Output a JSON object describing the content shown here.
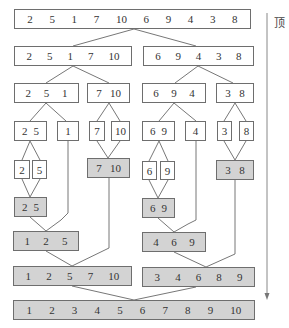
{
  "side_label": "顶",
  "colors": {
    "border": "#6e6e6e",
    "shaded": "#d3d3d3",
    "line": "#777777"
  },
  "boxes": [
    {
      "id": "b0",
      "values": [
        "2",
        "5",
        "1",
        "7",
        "10",
        "6",
        "9",
        "4",
        "3",
        "8"
      ],
      "x": 14,
      "y": 9,
      "w": 237,
      "h": 20,
      "shaded": false
    },
    {
      "id": "b1",
      "values": [
        "2",
        "5",
        "1",
        "7",
        "10"
      ],
      "x": 14,
      "y": 46,
      "w": 118,
      "h": 20,
      "shaded": false
    },
    {
      "id": "b2",
      "values": [
        "6",
        "9",
        "4",
        "3",
        "8"
      ],
      "x": 143,
      "y": 46,
      "w": 111,
      "h": 20,
      "shaded": false
    },
    {
      "id": "b3",
      "values": [
        "2",
        "5",
        "1"
      ],
      "x": 14,
      "y": 83,
      "w": 65,
      "h": 20,
      "shaded": false
    },
    {
      "id": "b4",
      "values": [
        "7",
        "10"
      ],
      "x": 87,
      "y": 83,
      "w": 43,
      "h": 20,
      "shaded": false
    },
    {
      "id": "b5",
      "values": [
        "6",
        "9",
        "4"
      ],
      "x": 142,
      "y": 83,
      "w": 64,
      "h": 20,
      "shaded": false
    },
    {
      "id": "b6",
      "values": [
        "3",
        "8"
      ],
      "x": 216,
      "y": 83,
      "w": 38,
      "h": 20,
      "shaded": false
    },
    {
      "id": "b7",
      "values": [
        "2",
        "5"
      ],
      "x": 14,
      "y": 121,
      "w": 33,
      "h": 20,
      "shaded": false
    },
    {
      "id": "b8",
      "values": [
        "1"
      ],
      "x": 57,
      "y": 121,
      "w": 22,
      "h": 20,
      "shaded": false
    },
    {
      "id": "b9",
      "values": [
        "7"
      ],
      "x": 89,
      "y": 121,
      "w": 16,
      "h": 20,
      "shaded": false
    },
    {
      "id": "b10",
      "values": [
        "10"
      ],
      "x": 111,
      "y": 121,
      "w": 19,
      "h": 20,
      "shaded": false
    },
    {
      "id": "b11",
      "values": [
        "6",
        "9"
      ],
      "x": 142,
      "y": 121,
      "w": 33,
      "h": 20,
      "shaded": false
    },
    {
      "id": "b12",
      "values": [
        "4"
      ],
      "x": 185,
      "y": 121,
      "w": 21,
      "h": 20,
      "shaded": false
    },
    {
      "id": "b13",
      "values": [
        "3"
      ],
      "x": 217,
      "y": 121,
      "w": 15,
      "h": 20,
      "shaded": false
    },
    {
      "id": "b14",
      "values": [
        "8"
      ],
      "x": 239,
      "y": 121,
      "w": 15,
      "h": 20,
      "shaded": false
    },
    {
      "id": "b15",
      "values": [
        "2"
      ],
      "x": 14,
      "y": 160,
      "w": 16,
      "h": 19,
      "shaded": false
    },
    {
      "id": "b16",
      "values": [
        "5"
      ],
      "x": 32,
      "y": 160,
      "w": 15,
      "h": 19,
      "shaded": false
    },
    {
      "id": "b17",
      "values": [
        "7",
        "10"
      ],
      "x": 87,
      "y": 158,
      "w": 43,
      "h": 20,
      "shaded": true
    },
    {
      "id": "b18",
      "values": [
        "6"
      ],
      "x": 142,
      "y": 161,
      "w": 15,
      "h": 19,
      "shaded": false
    },
    {
      "id": "b19",
      "values": [
        "9"
      ],
      "x": 160,
      "y": 161,
      "w": 15,
      "h": 19,
      "shaded": false
    },
    {
      "id": "b20",
      "values": [
        "3",
        "8"
      ],
      "x": 216,
      "y": 160,
      "w": 38,
      "h": 20,
      "shaded": true
    },
    {
      "id": "b21",
      "values": [
        "2",
        "5"
      ],
      "x": 14,
      "y": 197,
      "w": 33,
      "h": 20,
      "shaded": true
    },
    {
      "id": "b22",
      "values": [
        "6",
        "9"
      ],
      "x": 142,
      "y": 198,
      "w": 33,
      "h": 20,
      "shaded": true
    },
    {
      "id": "b23",
      "values": [
        "1",
        "2",
        "5"
      ],
      "x": 13,
      "y": 231,
      "w": 66,
      "h": 20,
      "shaded": true
    },
    {
      "id": "b24",
      "values": [
        "4",
        "6",
        "9"
      ],
      "x": 142,
      "y": 232,
      "w": 64,
      "h": 20,
      "shaded": true
    },
    {
      "id": "b25",
      "values": [
        "1",
        "2",
        "5",
        "7",
        "10"
      ],
      "x": 13,
      "y": 266,
      "w": 119,
      "h": 20,
      "shaded": true
    },
    {
      "id": "b26",
      "values": [
        "3",
        "4",
        "6",
        "8",
        "9"
      ],
      "x": 142,
      "y": 267,
      "w": 113,
      "h": 20,
      "shaded": true
    },
    {
      "id": "b27",
      "values": [
        "1",
        "2",
        "3",
        "4",
        "5",
        "6",
        "7",
        "8",
        "9",
        "10"
      ],
      "x": 13,
      "y": 300,
      "w": 242,
      "h": 20,
      "shaded": true
    }
  ],
  "lines": [
    [
      134,
      29,
      73,
      46
    ],
    [
      134,
      29,
      196,
      46
    ],
    [
      73,
      66,
      46,
      83
    ],
    [
      73,
      66,
      109,
      83
    ],
    [
      198,
      66,
      175,
      83
    ],
    [
      198,
      66,
      233,
      83
    ],
    [
      46,
      103,
      30,
      121
    ],
    [
      46,
      103,
      66,
      121
    ],
    [
      109,
      103,
      97,
      121
    ],
    [
      109,
      103,
      120,
      121
    ],
    [
      174,
      103,
      159,
      121
    ],
    [
      174,
      103,
      196,
      121
    ],
    [
      235,
      103,
      224,
      121
    ],
    [
      235,
      103,
      246,
      121
    ],
    [
      30,
      141,
      22,
      160
    ],
    [
      30,
      141,
      40,
      160
    ],
    [
      97,
      141,
      108,
      158
    ],
    [
      120,
      141,
      108,
      158
    ],
    [
      159,
      141,
      149,
      161
    ],
    [
      159,
      141,
      168,
      161
    ],
    [
      224,
      141,
      235,
      160
    ],
    [
      246,
      141,
      235,
      160
    ],
    [
      22,
      179,
      30,
      197
    ],
    [
      40,
      179,
      30,
      197
    ],
    [
      149,
      180,
      158,
      198
    ],
    [
      168,
      180,
      158,
      198
    ],
    [
      68,
      141,
      68,
      213
    ],
    [
      68,
      213,
      61,
      220
    ],
    [
      61,
      220,
      46,
      231
    ],
    [
      196,
      141,
      196,
      220
    ],
    [
      196,
      220,
      188,
      224
    ],
    [
      188,
      224,
      174,
      232
    ],
    [
      30,
      217,
      46,
      231
    ],
    [
      158,
      218,
      174,
      232
    ],
    [
      109,
      178,
      109,
      248
    ],
    [
      109,
      248,
      72,
      266
    ],
    [
      46,
      251,
      72,
      266
    ],
    [
      235,
      180,
      235,
      254
    ],
    [
      235,
      254,
      206,
      267
    ],
    [
      174,
      252,
      206,
      267
    ],
    [
      72,
      286,
      134,
      300
    ],
    [
      196,
      287,
      134,
      300
    ]
  ],
  "arrow": {
    "x": 267,
    "y1": 13,
    "y2": 300
  }
}
